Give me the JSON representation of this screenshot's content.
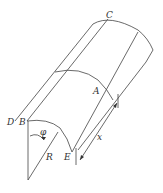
{
  "diagram": {
    "labels": {
      "C": "C",
      "A": "A",
      "D": "D",
      "B": "B",
      "E": "E",
      "R": "R",
      "phi": "φ",
      "x": "x"
    }
  }
}
